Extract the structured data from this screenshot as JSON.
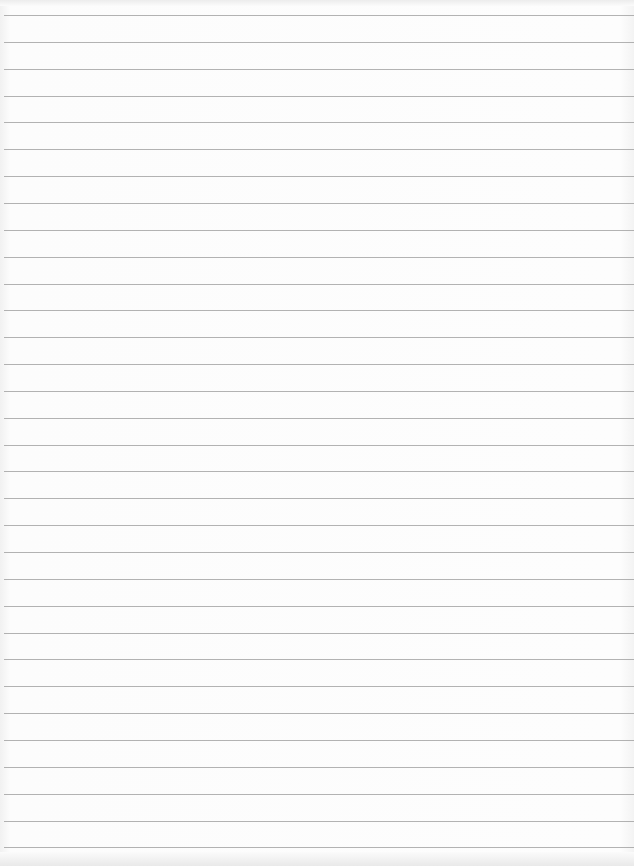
{
  "page": {
    "type": "blank lined paper",
    "background_color": "#fbfbfb",
    "rule_color": "#9a9a9a",
    "rules": {
      "count": 32,
      "first_y": 15,
      "spacing": 26.85
    }
  }
}
